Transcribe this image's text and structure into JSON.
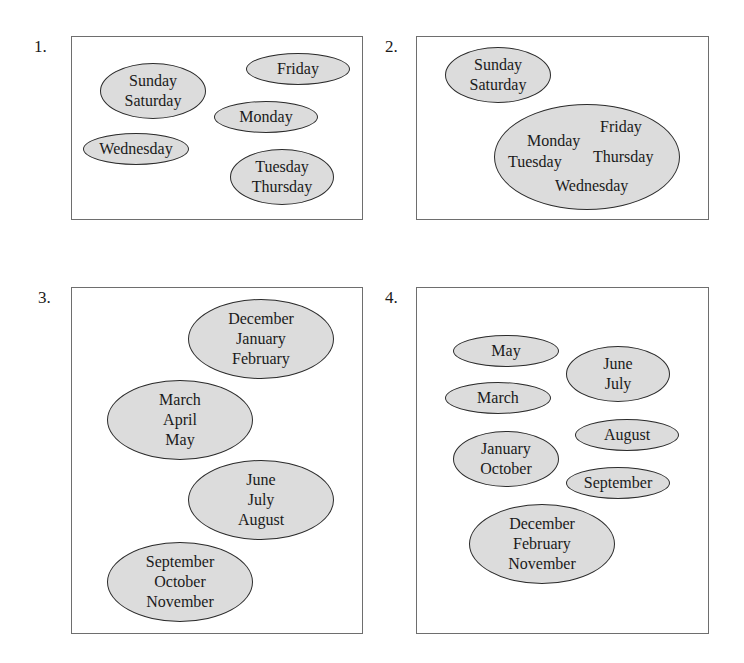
{
  "figure": {
    "panels": [
      {
        "number": "1.",
        "groups": [
          {
            "id": "p1-g1",
            "items": [
              "Sunday",
              "Saturday"
            ]
          },
          {
            "id": "p1-g2",
            "items": [
              "Friday"
            ]
          },
          {
            "id": "p1-g3",
            "items": [
              "Monday"
            ]
          },
          {
            "id": "p1-g4",
            "items": [
              "Wednesday"
            ]
          },
          {
            "id": "p1-g5",
            "items": [
              "Tuesday",
              "Thursday"
            ]
          }
        ]
      },
      {
        "number": "2.",
        "groups": [
          {
            "id": "p2-g1",
            "items": [
              "Sunday",
              "Saturday"
            ]
          },
          {
            "id": "p2-g2",
            "items": [
              "Monday",
              "Tuesday",
              "Friday",
              "Thursday",
              "Wednesday"
            ]
          }
        ]
      },
      {
        "number": "3.",
        "groups": [
          {
            "id": "p3-g1",
            "items": [
              "December",
              "January",
              "February"
            ]
          },
          {
            "id": "p3-g2",
            "items": [
              "March",
              "April",
              "May"
            ]
          },
          {
            "id": "p3-g3",
            "items": [
              "June",
              "July",
              "August"
            ]
          },
          {
            "id": "p3-g4",
            "items": [
              "September",
              "October",
              "November"
            ]
          }
        ]
      },
      {
        "number": "4.",
        "groups": [
          {
            "id": "p4-g1",
            "items": [
              "May"
            ]
          },
          {
            "id": "p4-g2",
            "items": [
              "June",
              "July"
            ]
          },
          {
            "id": "p4-g3",
            "items": [
              "March"
            ]
          },
          {
            "id": "p4-g4",
            "items": [
              "August"
            ]
          },
          {
            "id": "p4-g5",
            "items": [
              "January",
              "October"
            ]
          },
          {
            "id": "p4-g6",
            "items": [
              "September"
            ]
          },
          {
            "id": "p4-g7",
            "items": [
              "December",
              "February",
              "November"
            ]
          }
        ]
      }
    ],
    "colors": {
      "ellipse_fill": "#dcdcdc",
      "ellipse_stroke": "#2b2b2b",
      "frame_stroke": "#6e6e6e",
      "text": "#1a1a1a"
    }
  }
}
